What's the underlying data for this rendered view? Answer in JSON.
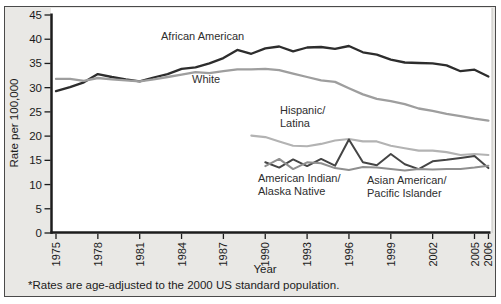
{
  "chart_data": {
    "type": "line",
    "title": "",
    "xlabel": "Year",
    "ylabel": "Rate per 100,000",
    "footnote": "*Rates are age-adjusted to the 2000 US standard population.",
    "xlim": [
      1975,
      2006
    ],
    "ylim": [
      0,
      45
    ],
    "x_ticks": [
      1975,
      1978,
      1981,
      1984,
      1987,
      1990,
      1993,
      1996,
      1999,
      2002,
      2005,
      2006
    ],
    "y_ticks": [
      0,
      5,
      10,
      15,
      20,
      25,
      30,
      35,
      40,
      45
    ],
    "grid": false,
    "legend_position": "inline-annotations",
    "axis_color": "#1c1c1c",
    "plot_background": "#ffffff",
    "figure_background": "#e9e8e5",
    "series": [
      {
        "name": "African American",
        "label_lines": [
          "African American"
        ],
        "color": "#2d2d2d",
        "width": 2.3,
        "start_year": 1975,
        "values": [
          29.3,
          30.1,
          31.1,
          32.8,
          32.2,
          31.7,
          31.3,
          32.1,
          32.8,
          33.9,
          34.2,
          35.0,
          36.1,
          37.8,
          37.0,
          38.1,
          38.5,
          37.5,
          38.3,
          38.4,
          38.0,
          38.6,
          37.3,
          36.8,
          35.8,
          35.2,
          35.1,
          35.0,
          34.6,
          33.4,
          33.7,
          32.3
        ]
      },
      {
        "name": "White",
        "label_lines": [
          "White"
        ],
        "color": "#9e9e9e",
        "width": 2.3,
        "start_year": 1975,
        "values": [
          31.8,
          31.8,
          31.4,
          32.0,
          31.7,
          31.5,
          31.3,
          31.7,
          32.2,
          32.7,
          33.2,
          33.0,
          33.4,
          33.8,
          33.8,
          33.9,
          33.6,
          32.9,
          32.2,
          31.5,
          31.2,
          29.9,
          28.6,
          27.7,
          27.2,
          26.6,
          25.7,
          25.2,
          24.6,
          24.1,
          23.6,
          23.2
        ]
      },
      {
        "name": "Hispanic/Latina",
        "label_lines": [
          "Hispanic/",
          "Latina"
        ],
        "color": "#b3b3b3",
        "width": 2.1,
        "start_year": 1989,
        "values": [
          20.1,
          19.8,
          18.9,
          18.0,
          17.9,
          18.4,
          19.1,
          19.4,
          18.9,
          18.9,
          18.0,
          17.5,
          17.0,
          17.0,
          16.7,
          16.1,
          16.3,
          16.1
        ]
      },
      {
        "name": "American Indian/Alaska Native",
        "label_lines": [
          "American Indian/",
          "Alaska Native"
        ],
        "color": "#454545",
        "width": 2.0,
        "start_year": 1990,
        "values": [
          14.6,
          13.5,
          15.2,
          13.8,
          15.3,
          13.9,
          19.3,
          14.6,
          14.0,
          16.3,
          14.2,
          13.2,
          14.8,
          15.1,
          15.5,
          15.9,
          13.4
        ]
      },
      {
        "name": "Asian American/Pacific Islander",
        "label_lines": [
          "Asian American/",
          "Pacific Islander"
        ],
        "color": "#8f8f8f",
        "width": 2.0,
        "start_year": 1990,
        "values": [
          13.8,
          15.3,
          13.2,
          14.6,
          14.4,
          13.4,
          13.0,
          13.6,
          13.5,
          13.2,
          12.9,
          13.2,
          13.1,
          13.2,
          13.2,
          13.5,
          13.9
        ]
      }
    ]
  }
}
